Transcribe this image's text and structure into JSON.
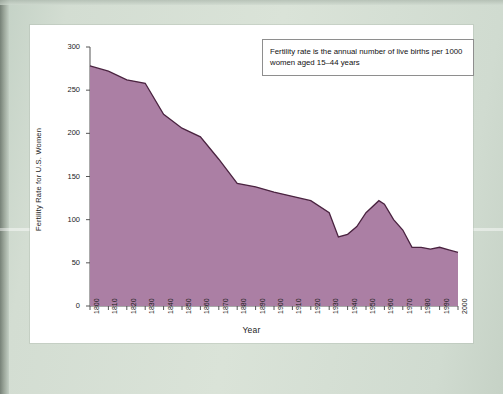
{
  "figure": {
    "annotation": "Fertility rate is the annual number of live births per 1000 women aged 15–44 years",
    "area_fill_color": "#ab7fa4",
    "area_line_color": "#4a2340",
    "card_background": "#ffffff",
    "mat_background": "#d3ddd2"
  },
  "chart_data": {
    "type": "area",
    "title": "",
    "xlabel": "Year",
    "ylabel": "Fertility Rate for U.S. Women",
    "xlim": [
      1800,
      2000
    ],
    "ylim": [
      0,
      300
    ],
    "grid": false,
    "legend": "none",
    "annotations": [
      "Fertility rate is the annual number of live births per 1000 women aged 15–44 years"
    ],
    "ytick_labels": [
      "0",
      "50",
      "100",
      "150",
      "200",
      "250",
      "300"
    ],
    "ytick_values": [
      0,
      50,
      100,
      150,
      200,
      250,
      300
    ],
    "xtick_labels": [
      "1800",
      "1810",
      "1820",
      "1830",
      "1840",
      "1850",
      "1860",
      "1870",
      "1880",
      "1890",
      "1900",
      "1910",
      "1920",
      "1930",
      "1940",
      "1950",
      "1960",
      "1970",
      "1980",
      "1990",
      "2000"
    ],
    "xtick_values": [
      1800,
      1810,
      1820,
      1830,
      1840,
      1850,
      1860,
      1870,
      1880,
      1890,
      1900,
      1910,
      1920,
      1930,
      1940,
      1950,
      1960,
      1970,
      1980,
      1990,
      2000
    ],
    "x": [
      1800,
      1810,
      1820,
      1830,
      1840,
      1850,
      1860,
      1870,
      1880,
      1890,
      1900,
      1910,
      1920,
      1930,
      1935,
      1940,
      1945,
      1950,
      1957,
      1960,
      1965,
      1970,
      1975,
      1980,
      1985,
      1990,
      1995,
      2000
    ],
    "values": [
      278,
      272,
      262,
      258,
      222,
      206,
      196,
      170,
      142,
      138,
      132,
      127,
      122,
      108,
      80,
      83,
      92,
      108,
      122,
      118,
      100,
      88,
      68,
      68,
      66,
      68,
      65,
      62
    ],
    "series_name": "Fertility rate (births per 1000 women aged 15-44)"
  }
}
